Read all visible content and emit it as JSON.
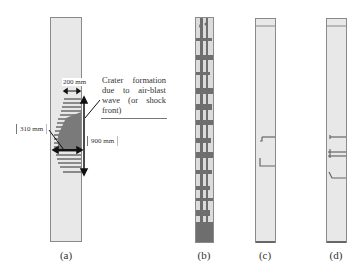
{
  "figure": {
    "panels": [
      {
        "id": "a",
        "label": "(a)",
        "description": "column with crater formation"
      },
      {
        "id": "b",
        "label": "(b)",
        "description": "column with extensive damage"
      },
      {
        "id": "c",
        "label": "(c)",
        "description": "column with minor cracks"
      },
      {
        "id": "d",
        "label": "(d)",
        "description": "column with several cracks"
      }
    ],
    "annotations": {
      "crater_text": "Crater formation due to air-blast wave (or shock front)",
      "width_200": "200 mm",
      "width_310": "310 mm",
      "height_900": "900 mm"
    },
    "colors": {
      "column_fill": "#e8e8e8",
      "damage": "#777777",
      "outline": "#8a8a8a"
    }
  }
}
